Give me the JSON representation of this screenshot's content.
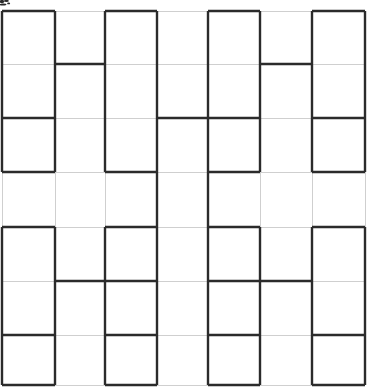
{
  "figure": {
    "canvas": {
      "width": 372,
      "height": 391,
      "background": "#ffffff"
    },
    "grid": {
      "label": "background grid",
      "color": "#cfcfcf",
      "stroke_width": 1,
      "visible": true,
      "x_positions": [
        2,
        55,
        105,
        157,
        208,
        260,
        312,
        365
      ],
      "y_positions": [
        11,
        64,
        118,
        172,
        227,
        281,
        335,
        385
      ],
      "columns": 7,
      "rows": 7
    },
    "fractal": {
      "label": "H-tree fractal path",
      "color": "#2b2b2b",
      "stroke_width": 2.4,
      "order": 3,
      "description": "Order-3 H-tree / recursive H fractal overlaid on a light grid",
      "segments": [
        {
          "name": "top-box-1-left",
          "x1": 2,
          "y1": 11,
          "x2": 2,
          "y2": 118
        },
        {
          "name": "top-box-1-top",
          "x1": 2,
          "y1": 11,
          "x2": 55,
          "y2": 11
        },
        {
          "name": "top-box-1-right",
          "x1": 55,
          "y1": 11,
          "x2": 55,
          "y2": 118
        },
        {
          "name": "top-box-2-left",
          "x1": 105,
          "y1": 11,
          "x2": 105,
          "y2": 118
        },
        {
          "name": "top-box-2-top",
          "x1": 105,
          "y1": 11,
          "x2": 157,
          "y2": 11
        },
        {
          "name": "top-box-2-right",
          "x1": 157,
          "y1": 11,
          "x2": 157,
          "y2": 118
        },
        {
          "name": "top-box-3-left",
          "x1": 208,
          "y1": 11,
          "x2": 208,
          "y2": 118
        },
        {
          "name": "top-box-3-top",
          "x1": 208,
          "y1": 11,
          "x2": 260,
          "y2": 11
        },
        {
          "name": "top-box-3-right",
          "x1": 260,
          "y1": 11,
          "x2": 260,
          "y2": 118
        },
        {
          "name": "top-box-4-left",
          "x1": 312,
          "y1": 11,
          "x2": 312,
          "y2": 118
        },
        {
          "name": "top-box-4-top",
          "x1": 312,
          "y1": 11,
          "x2": 365,
          "y2": 11
        },
        {
          "name": "top-box-4-right",
          "x1": 365,
          "y1": 11,
          "x2": 365,
          "y2": 118
        },
        {
          "name": "upper-crossbar-1",
          "x1": 55,
          "y1": 64,
          "x2": 105,
          "y2": 64
        },
        {
          "name": "upper-crossbar-2",
          "x1": 260,
          "y1": 64,
          "x2": 312,
          "y2": 64
        },
        {
          "name": "mid-crossbar-1",
          "x1": 2,
          "y1": 118,
          "x2": 55,
          "y2": 118
        },
        {
          "name": "mid-crossbar-2",
          "x1": 157,
          "y1": 118,
          "x2": 260,
          "y2": 118
        },
        {
          "name": "mid-crossbar-3",
          "x1": 312,
          "y1": 118,
          "x2": 365,
          "y2": 118
        },
        {
          "name": "upper-bottom-1-left",
          "x1": 2,
          "y1": 118,
          "x2": 2,
          "y2": 172
        },
        {
          "name": "upper-bottom-1-right",
          "x1": 55,
          "y1": 118,
          "x2": 55,
          "y2": 172
        },
        {
          "name": "upper-bottom-1-base",
          "x1": 2,
          "y1": 172,
          "x2": 55,
          "y2": 172
        },
        {
          "name": "upper-bottom-2-left",
          "x1": 105,
          "y1": 118,
          "x2": 105,
          "y2": 172
        },
        {
          "name": "upper-bottom-2-right",
          "x1": 157,
          "y1": 118,
          "x2": 157,
          "y2": 172
        },
        {
          "name": "upper-bottom-2-base",
          "x1": 105,
          "y1": 172,
          "x2": 157,
          "y2": 172
        },
        {
          "name": "upper-bottom-3-left",
          "x1": 208,
          "y1": 118,
          "x2": 208,
          "y2": 172
        },
        {
          "name": "upper-bottom-3-right",
          "x1": 260,
          "y1": 118,
          "x2": 260,
          "y2": 172
        },
        {
          "name": "upper-bottom-3-base",
          "x1": 208,
          "y1": 172,
          "x2": 260,
          "y2": 172
        },
        {
          "name": "upper-bottom-4-left",
          "x1": 312,
          "y1": 118,
          "x2": 312,
          "y2": 172
        },
        {
          "name": "upper-bottom-4-right",
          "x1": 365,
          "y1": 118,
          "x2": 365,
          "y2": 172
        },
        {
          "name": "upper-bottom-4-base",
          "x1": 312,
          "y1": 172,
          "x2": 365,
          "y2": 172
        },
        {
          "name": "center-stem-left",
          "x1": 157,
          "y1": 172,
          "x2": 157,
          "y2": 227
        },
        {
          "name": "center-stem-right",
          "x1": 208,
          "y1": 172,
          "x2": 208,
          "y2": 227
        },
        {
          "name": "lower-top-1-left",
          "x1": 2,
          "y1": 227,
          "x2": 2,
          "y2": 281
        },
        {
          "name": "lower-top-1-top",
          "x1": 2,
          "y1": 227,
          "x2": 55,
          "y2": 227
        },
        {
          "name": "lower-top-1-right",
          "x1": 55,
          "y1": 227,
          "x2": 55,
          "y2": 281
        },
        {
          "name": "lower-top-2-left",
          "x1": 105,
          "y1": 227,
          "x2": 105,
          "y2": 281
        },
        {
          "name": "lower-top-2-top",
          "x1": 105,
          "y1": 227,
          "x2": 157,
          "y2": 227
        },
        {
          "name": "lower-top-2-right",
          "x1": 157,
          "y1": 227,
          "x2": 157,
          "y2": 281
        },
        {
          "name": "lower-top-3-left",
          "x1": 208,
          "y1": 227,
          "x2": 208,
          "y2": 281
        },
        {
          "name": "lower-top-3-top",
          "x1": 208,
          "y1": 227,
          "x2": 260,
          "y2": 227
        },
        {
          "name": "lower-top-3-right",
          "x1": 260,
          "y1": 227,
          "x2": 260,
          "y2": 281
        },
        {
          "name": "lower-top-4-left",
          "x1": 312,
          "y1": 227,
          "x2": 312,
          "y2": 281
        },
        {
          "name": "lower-top-4-top",
          "x1": 312,
          "y1": 227,
          "x2": 365,
          "y2": 227
        },
        {
          "name": "lower-top-4-right",
          "x1": 365,
          "y1": 227,
          "x2": 365,
          "y2": 281
        },
        {
          "name": "lower-crossbar-1",
          "x1": 55,
          "y1": 281,
          "x2": 157,
          "y2": 281
        },
        {
          "name": "lower-crossbar-2",
          "x1": 208,
          "y1": 281,
          "x2": 260,
          "y2": 281
        },
        {
          "name": "lower-crossbar-3",
          "x1": 260,
          "y1": 281,
          "x2": 312,
          "y2": 281
        },
        {
          "name": "lower-crossbar-4",
          "x1": 2,
          "y1": 335,
          "x2": 55,
          "y2": 335
        },
        {
          "name": "lower-crossbar-5",
          "x1": 105,
          "y1": 335,
          "x2": 157,
          "y2": 335
        },
        {
          "name": "lower-crossbar-6",
          "x1": 208,
          "y1": 335,
          "x2": 260,
          "y2": 335
        },
        {
          "name": "lower-crossbar-7",
          "x1": 312,
          "y1": 335,
          "x2": 365,
          "y2": 335
        },
        {
          "name": "bottom-box-1-left",
          "x1": 2,
          "y1": 281,
          "x2": 2,
          "y2": 385
        },
        {
          "name": "bottom-box-1-right",
          "x1": 55,
          "y1": 281,
          "x2": 55,
          "y2": 385
        },
        {
          "name": "bottom-box-1-base",
          "x1": 2,
          "y1": 385,
          "x2": 55,
          "y2": 385
        },
        {
          "name": "bottom-box-2-left",
          "x1": 105,
          "y1": 281,
          "x2": 105,
          "y2": 385
        },
        {
          "name": "bottom-box-2-right",
          "x1": 157,
          "y1": 281,
          "x2": 157,
          "y2": 385
        },
        {
          "name": "bottom-box-2-base",
          "x1": 105,
          "y1": 385,
          "x2": 157,
          "y2": 385
        },
        {
          "name": "bottom-box-3-left",
          "x1": 208,
          "y1": 281,
          "x2": 208,
          "y2": 385
        },
        {
          "name": "bottom-box-3-right",
          "x1": 260,
          "y1": 281,
          "x2": 260,
          "y2": 385
        },
        {
          "name": "bottom-box-3-base",
          "x1": 208,
          "y1": 385,
          "x2": 260,
          "y2": 385
        },
        {
          "name": "bottom-box-4-left",
          "x1": 312,
          "y1": 281,
          "x2": 312,
          "y2": 385
        },
        {
          "name": "bottom-box-4-right",
          "x1": 365,
          "y1": 281,
          "x2": 365,
          "y2": 385
        },
        {
          "name": "bottom-box-4-base",
          "x1": 312,
          "y1": 385,
          "x2": 365,
          "y2": 385
        }
      ]
    },
    "artifact": {
      "label": "scan smudge",
      "color": "#2b2b2b",
      "x": 0,
      "y": 0,
      "width": 11,
      "height": 8
    }
  }
}
